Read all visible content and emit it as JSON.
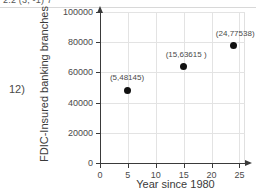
{
  "header": {
    "clipped_text": "2.2 (3, -1) 7"
  },
  "problem": {
    "number": "12)"
  },
  "chart_data": {
    "type": "scatter",
    "title": "",
    "xlabel": "Year since 1980",
    "ylabel": "FDIC-Insured banking branches",
    "xlim": [
      0,
      26
    ],
    "ylim": [
      0,
      100000
    ],
    "xticks": [
      "0",
      "5",
      "10",
      "15",
      "20",
      "25"
    ],
    "xtick_values": [
      0,
      5,
      10,
      15,
      20,
      25
    ],
    "yticks": [
      "0",
      "20000",
      "40000",
      "60000",
      "80000",
      "100000"
    ],
    "ytick_values": [
      0,
      20000,
      40000,
      60000,
      80000,
      100000
    ],
    "grid": true,
    "legend": "none",
    "marker_color": "#111111",
    "points": [
      {
        "x": 5,
        "y": 48145,
        "label": "(5,48145)"
      },
      {
        "x": 15,
        "y": 63615,
        "label": "(15,63615 )"
      },
      {
        "x": 24,
        "y": 77538,
        "label": "(24,77538)"
      }
    ]
  }
}
